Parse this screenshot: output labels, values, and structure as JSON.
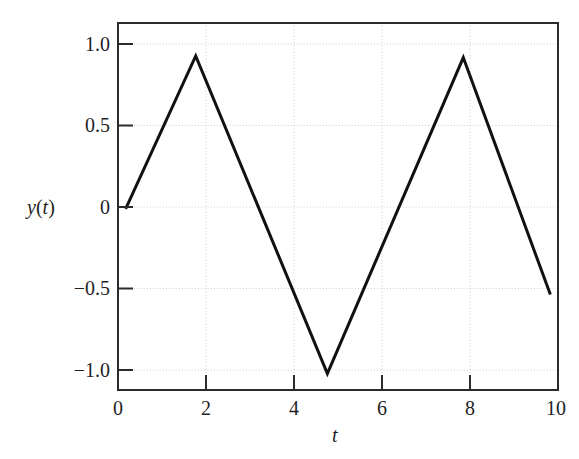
{
  "chart_data": {
    "type": "line",
    "title": "",
    "subtitle": "",
    "xlabel": "t",
    "ylabel": "y(t)",
    "xlim": [
      -0.18,
      10.18
    ],
    "ylim": [
      -1.1,
      1.13
    ],
    "xticks": [
      0,
      2,
      4,
      6,
      8,
      10
    ],
    "xtick_labels": [
      "0",
      "2",
      "4",
      "6",
      "8",
      "10"
    ],
    "yticks": [
      -1.0,
      -0.5,
      0,
      0.5,
      1.0
    ],
    "ytick_labels": [
      "−1.0",
      "−0.5",
      "0",
      "0.5",
      "1.0"
    ],
    "grid": true,
    "grid_style": "dotted",
    "legend": null,
    "legend_position": "none",
    "line_color": "#111111",
    "line_width": 3,
    "frame_color": "#2b2b2b",
    "grid_color": "#cfcfcf",
    "background_color": "#ffffff",
    "series": [
      {
        "name": "y(t)",
        "x": [
          0.0,
          1.65,
          4.75,
          7.95,
          10.0
        ],
        "y": [
          0.0,
          0.93,
          -1.0,
          0.92,
          -0.52
        ]
      }
    ],
    "annotations": []
  },
  "axes": {
    "y_tick_0": "1.0",
    "y_tick_1": "0.5",
    "y_tick_2": "0",
    "y_tick_3": "−0.5",
    "y_tick_4": "−1.0",
    "x_tick_0": "0",
    "x_tick_1": "2",
    "x_tick_2": "4",
    "x_tick_3": "6",
    "x_tick_4": "8",
    "x_tick_5": "10",
    "x_axis_title": "t",
    "y_axis_title_prefix": "y",
    "y_axis_title_open": "(",
    "y_axis_title_var": "t",
    "y_axis_title_close": ")"
  }
}
